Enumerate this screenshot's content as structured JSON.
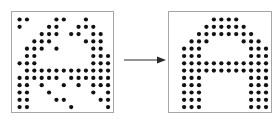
{
  "figure": {
    "title": "Dot matrix pattern restoration",
    "caption_left": "noisy input pattern",
    "caption_right": "restored pattern",
    "background_color": "#ffffff",
    "dot_color": "#111111",
    "panel_border_color": "#a6a6a6",
    "arrow_color": "#2b2b2b"
  },
  "grid": {
    "columns": 13,
    "rows": 13,
    "cell_size": 7.3,
    "dot_radius": 2.1,
    "origin_x": 7.5,
    "origin_y": 7.5
  },
  "arrow": {
    "direction": "right",
    "label": "transforms-to"
  },
  "left_panel": {
    "name": "noisy-dot-pattern",
    "description": "Degraded dot-matrix rendering of the letter A with speckle noise and missing dots",
    "dots": [
      [
        0,
        0
      ],
      [
        1,
        0
      ],
      [
        5,
        0
      ],
      [
        6,
        0
      ],
      [
        9,
        0
      ],
      [
        0,
        1
      ],
      [
        4,
        1
      ],
      [
        5,
        1
      ],
      [
        8,
        1
      ],
      [
        9,
        1
      ],
      [
        10,
        1
      ],
      [
        3,
        2
      ],
      [
        4,
        2
      ],
      [
        5,
        2
      ],
      [
        7,
        2
      ],
      [
        8,
        2
      ],
      [
        10,
        2
      ],
      [
        11,
        2
      ],
      [
        2,
        3
      ],
      [
        3,
        3
      ],
      [
        4,
        3
      ],
      [
        9,
        3
      ],
      [
        10,
        3
      ],
      [
        11,
        3
      ],
      [
        1,
        4
      ],
      [
        2,
        4
      ],
      [
        3,
        4
      ],
      [
        5,
        4
      ],
      [
        10,
        4
      ],
      [
        11,
        4
      ],
      [
        13,
        4
      ],
      [
        1,
        5
      ],
      [
        2,
        5
      ],
      [
        10,
        5
      ],
      [
        11,
        5
      ],
      [
        12,
        5
      ],
      [
        13,
        5
      ],
      [
        0,
        6
      ],
      [
        1,
        6
      ],
      [
        2,
        6
      ],
      [
        10,
        6
      ],
      [
        11,
        6
      ],
      [
        12,
        6
      ],
      [
        1,
        7
      ],
      [
        2,
        7
      ],
      [
        3,
        7
      ],
      [
        4,
        7
      ],
      [
        5,
        7
      ],
      [
        6,
        7
      ],
      [
        7,
        7
      ],
      [
        8,
        7
      ],
      [
        9,
        7
      ],
      [
        10,
        7
      ],
      [
        11,
        7
      ],
      [
        12,
        7
      ],
      [
        0,
        8
      ],
      [
        1,
        8
      ],
      [
        2,
        8
      ],
      [
        3,
        8
      ],
      [
        4,
        8
      ],
      [
        5,
        8
      ],
      [
        7,
        8
      ],
      [
        8,
        8
      ],
      [
        9,
        8
      ],
      [
        10,
        8
      ],
      [
        11,
        8
      ],
      [
        12,
        8
      ],
      [
        13,
        8
      ],
      [
        0,
        9
      ],
      [
        1,
        9
      ],
      [
        3,
        9
      ],
      [
        6,
        9
      ],
      [
        8,
        9
      ],
      [
        10,
        9
      ],
      [
        11,
        9
      ],
      [
        12,
        9
      ],
      [
        13,
        9
      ],
      [
        0,
        10
      ],
      [
        1,
        10
      ],
      [
        4,
        10
      ],
      [
        10,
        10
      ],
      [
        12,
        10
      ],
      [
        13,
        10
      ],
      [
        0,
        11
      ],
      [
        1,
        11
      ],
      [
        5,
        11
      ],
      [
        6,
        11
      ],
      [
        11,
        11
      ],
      [
        12,
        11
      ],
      [
        0,
        12
      ],
      [
        1,
        12
      ],
      [
        7,
        12
      ],
      [
        12,
        12
      ],
      [
        13,
        12
      ]
    ]
  },
  "right_panel": {
    "name": "restored-dot-pattern",
    "description": "Clean dot-matrix rendering of the letter A: solid arch with two legs",
    "dots": [
      [
        5,
        0
      ],
      [
        6,
        0
      ],
      [
        7,
        0
      ],
      [
        8,
        0
      ],
      [
        4,
        1
      ],
      [
        5,
        1
      ],
      [
        6,
        1
      ],
      [
        7,
        1
      ],
      [
        8,
        1
      ],
      [
        9,
        1
      ],
      [
        3,
        2
      ],
      [
        4,
        2
      ],
      [
        5,
        2
      ],
      [
        6,
        2
      ],
      [
        7,
        2
      ],
      [
        8,
        2
      ],
      [
        9,
        2
      ],
      [
        10,
        2
      ],
      [
        2,
        3
      ],
      [
        3,
        3
      ],
      [
        4,
        3
      ],
      [
        9,
        3
      ],
      [
        10,
        3
      ],
      [
        11,
        3
      ],
      [
        1,
        4
      ],
      [
        2,
        4
      ],
      [
        3,
        4
      ],
      [
        10,
        4
      ],
      [
        11,
        4
      ],
      [
        12,
        4
      ],
      [
        1,
        5
      ],
      [
        2,
        5
      ],
      [
        3,
        5
      ],
      [
        10,
        5
      ],
      [
        11,
        5
      ],
      [
        12,
        5
      ],
      [
        1,
        6
      ],
      [
        2,
        6
      ],
      [
        3,
        6
      ],
      [
        4,
        6
      ],
      [
        5,
        6
      ],
      [
        6,
        6
      ],
      [
        7,
        6
      ],
      [
        8,
        6
      ],
      [
        9,
        6
      ],
      [
        10,
        6
      ],
      [
        11,
        6
      ],
      [
        12,
        6
      ],
      [
        1,
        7
      ],
      [
        2,
        7
      ],
      [
        3,
        7
      ],
      [
        4,
        7
      ],
      [
        5,
        7
      ],
      [
        6,
        7
      ],
      [
        7,
        7
      ],
      [
        8,
        7
      ],
      [
        9,
        7
      ],
      [
        10,
        7
      ],
      [
        11,
        7
      ],
      [
        12,
        7
      ],
      [
        1,
        8
      ],
      [
        2,
        8
      ],
      [
        3,
        8
      ],
      [
        10,
        8
      ],
      [
        11,
        8
      ],
      [
        12,
        8
      ],
      [
        1,
        9
      ],
      [
        2,
        9
      ],
      [
        3,
        9
      ],
      [
        10,
        9
      ],
      [
        11,
        9
      ],
      [
        12,
        9
      ],
      [
        1,
        10
      ],
      [
        2,
        10
      ],
      [
        3,
        10
      ],
      [
        10,
        10
      ],
      [
        11,
        10
      ],
      [
        12,
        10
      ],
      [
        1,
        11
      ],
      [
        2,
        11
      ],
      [
        3,
        11
      ],
      [
        10,
        11
      ],
      [
        11,
        11
      ],
      [
        12,
        11
      ],
      [
        1,
        12
      ],
      [
        2,
        12
      ],
      [
        3,
        12
      ],
      [
        10,
        12
      ],
      [
        11,
        12
      ],
      [
        12,
        12
      ]
    ]
  }
}
